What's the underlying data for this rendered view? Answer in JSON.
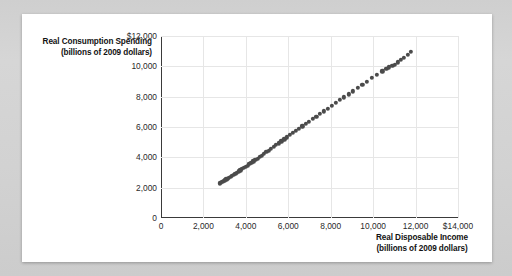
{
  "chart_data": {
    "type": "scatter",
    "title": "",
    "xlabel": "Real Disposable Income",
    "xlabel_sub": "(billions of 2009 dollars)",
    "ylabel": "Real Consumption Spending",
    "ylabel_sub": "(billions of 2009 dollars)",
    "xlim": [
      0,
      14000
    ],
    "ylim": [
      0,
      12000
    ],
    "grid": true,
    "legend": "none",
    "marker_color": "#4b4b4b",
    "xticks": [
      0,
      2000,
      4000,
      6000,
      8000,
      10000,
      12000,
      14000
    ],
    "xtick_labels": [
      "0",
      "2,000",
      "4,000",
      "6,000",
      "8,000",
      "10,000",
      "12,000",
      "$14,000"
    ],
    "yticks": [
      0,
      2000,
      4000,
      6000,
      8000,
      10000,
      12000
    ],
    "ytick_labels": [
      "0",
      "2,000",
      "4,000",
      "6,000",
      "8,000",
      "10,000",
      "$12,000"
    ],
    "points": [
      [
        2780,
        2290
      ],
      [
        2830,
        2330
      ],
      [
        2890,
        2380
      ],
      [
        2950,
        2430
      ],
      [
        3010,
        2480
      ],
      [
        3080,
        2540
      ],
      [
        3140,
        2600
      ],
      [
        3210,
        2660
      ],
      [
        3280,
        2720
      ],
      [
        3350,
        2790
      ],
      [
        3420,
        2860
      ],
      [
        3500,
        2930
      ],
      [
        3580,
        3000
      ],
      [
        3660,
        3070
      ],
      [
        3740,
        3150
      ],
      [
        3820,
        3220
      ],
      [
        3900,
        3300
      ],
      [
        3990,
        3380
      ],
      [
        4080,
        3460
      ],
      [
        4170,
        3550
      ],
      [
        4260,
        3640
      ],
      [
        4350,
        3730
      ],
      [
        4450,
        3820
      ],
      [
        4550,
        3920
      ],
      [
        4650,
        4020
      ],
      [
        4750,
        4120
      ],
      [
        4860,
        4230
      ],
      [
        4970,
        4340
      ],
      [
        5080,
        4450
      ],
      [
        5190,
        4560
      ],
      [
        5310,
        4680
      ],
      [
        5430,
        4800
      ],
      [
        5550,
        4930
      ],
      [
        5680,
        5060
      ],
      [
        5810,
        5190
      ],
      [
        5940,
        5320
      ],
      [
        6080,
        5460
      ],
      [
        6220,
        5600
      ],
      [
        6360,
        5740
      ],
      [
        6510,
        5890
      ],
      [
        6660,
        6040
      ],
      [
        6820,
        6200
      ],
      [
        6980,
        6360
      ],
      [
        7150,
        6520
      ],
      [
        7320,
        6690
      ],
      [
        7490,
        6860
      ],
      [
        7670,
        7030
      ],
      [
        7850,
        7210
      ],
      [
        8040,
        7390
      ],
      [
        8230,
        7580
      ],
      [
        8430,
        7770
      ],
      [
        8630,
        7960
      ],
      [
        8840,
        8160
      ],
      [
        9050,
        8360
      ],
      [
        9270,
        8570
      ],
      [
        9490,
        8780
      ],
      [
        9720,
        9000
      ],
      [
        9950,
        9220
      ],
      [
        10190,
        9440
      ],
      [
        10430,
        9670
      ],
      [
        10620,
        9840
      ],
      [
        10750,
        9930
      ],
      [
        10900,
        10010
      ],
      [
        11020,
        10120
      ],
      [
        11160,
        10260
      ],
      [
        11310,
        10410
      ],
      [
        11460,
        10570
      ],
      [
        11620,
        10740
      ],
      [
        11790,
        10950
      ]
    ]
  }
}
